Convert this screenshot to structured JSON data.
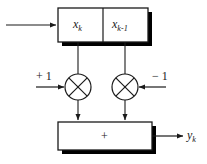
{
  "diagram": {
    "background_color": "#ffffff",
    "stroke_color": "#1a1a1a",
    "shadow_color": "#000000",
    "register": {
      "name": "delay-register",
      "cells": [
        {
          "label_base": "x",
          "label_sub": "k",
          "name": "register-cell-xk"
        },
        {
          "label_base": "x",
          "label_sub": "k-1",
          "name": "register-cell-xk-1"
        }
      ]
    },
    "multipliers": [
      {
        "name": "multiplier-left",
        "symbol": "x",
        "gain": "+ 1"
      },
      {
        "name": "multiplier-right",
        "symbol": "x",
        "gain": "− 1"
      }
    ],
    "adder": {
      "name": "summing-block",
      "symbol": "+"
    },
    "input": {
      "name": "input-signal",
      "label": ""
    },
    "output": {
      "name": "output-signal",
      "label_base": "y",
      "label_sub": "k"
    }
  }
}
